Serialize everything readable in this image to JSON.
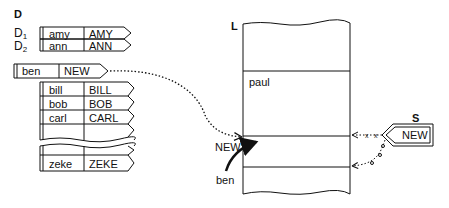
{
  "table_D": {
    "title": "D",
    "markers": [
      {
        "name": "D",
        "sub": "1"
      },
      {
        "name": "D",
        "sub": "2"
      }
    ],
    "rows_top": [
      {
        "key": "amy",
        "value": "AMY"
      },
      {
        "key": "ann",
        "value": "ANN"
      }
    ],
    "inserted": {
      "key": "ben",
      "value": "NEW"
    },
    "rows_mid": [
      {
        "key": "bill",
        "value": "BILL"
      },
      {
        "key": "bob",
        "value": "BOB"
      },
      {
        "key": "carl",
        "value": "CARL"
      },
      {
        "key": "",
        "value": ""
      }
    ],
    "rows_bottom": [
      {
        "key": "",
        "value": ""
      },
      {
        "key": "zeke",
        "value": "ZEKE"
      }
    ]
  },
  "list_L": {
    "title": "L",
    "cell_label": "paul",
    "new_label": "NEW",
    "ben_label": "ben"
  },
  "pointer_S": {
    "title": "S",
    "label": "NEW"
  }
}
